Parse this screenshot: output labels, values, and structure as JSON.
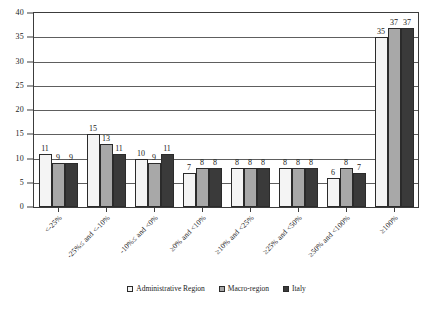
{
  "chart_data": {
    "type": "bar",
    "title": "",
    "subtitle": "",
    "xlabel": "",
    "ylabel": "",
    "ylim": [
      0,
      40
    ],
    "ytick_step": 5,
    "yticks": [
      0,
      5,
      10,
      15,
      20,
      25,
      30,
      35,
      40
    ],
    "grid": true,
    "legend_position": "bottom",
    "categories": [
      "<-25%",
      "-25%≤ and <-10%",
      "-10%≤ and <0%",
      "≥0% and <10%",
      "≥10% and <25%",
      "≥25% and <50%",
      "≥50% and <100%",
      "≥100%"
    ],
    "series": [
      {
        "name": "Administrative Region",
        "color": "#f4f4f4",
        "values": [
          11,
          15,
          10,
          7,
          8,
          8,
          6,
          35
        ]
      },
      {
        "name": "Macro-region",
        "color": "#a8a8a8",
        "values": [
          9,
          13,
          9,
          8,
          8,
          8,
          8,
          37
        ]
      },
      {
        "name": "Italy",
        "color": "#3a3a3a",
        "values": [
          9,
          11,
          11,
          8,
          8,
          8,
          7,
          37
        ]
      }
    ]
  }
}
